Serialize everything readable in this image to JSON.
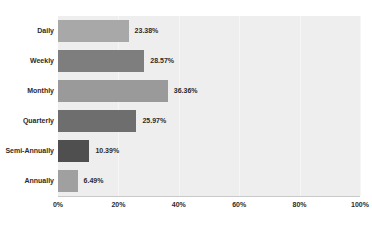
{
  "chart_data": {
    "type": "bar",
    "orientation": "horizontal",
    "title": "",
    "xlabel": "",
    "ylabel": "",
    "categories": [
      "Daily",
      "Weekly",
      "Monthly",
      "Quarterly",
      "Semi-Annually",
      "Annually"
    ],
    "values": [
      23.38,
      28.57,
      36.36,
      25.97,
      10.39,
      6.49
    ],
    "value_labels": [
      "23.38%",
      "28.57%",
      "36.36%",
      "25.97%",
      "10.39%",
      "6.49%"
    ],
    "bar_colors": [
      "#a8a8a8",
      "#7e7e7e",
      "#9a9a9a",
      "#6e6e6e",
      "#4f4f4f",
      "#a0a0a0"
    ],
    "xlim": [
      0,
      100
    ],
    "xticks": [
      0,
      20,
      40,
      60,
      80,
      100
    ],
    "xtick_labels": [
      "0%",
      "20%",
      "40%",
      "60%",
      "80%",
      "100%"
    ],
    "grid": true,
    "legend": false,
    "plot_background": "#eeeeee",
    "page_background": "#ffffff",
    "axis_color": "#c9c9c9",
    "text_color": "#2b2b2b"
  }
}
